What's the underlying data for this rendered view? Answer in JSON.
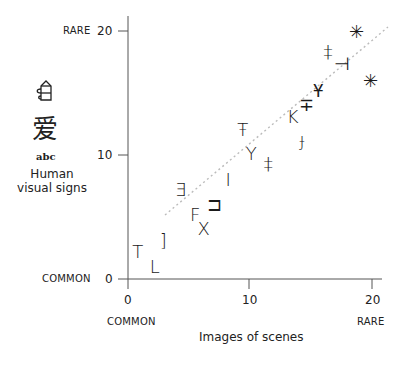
{
  "chart_data": {
    "type": "scatter",
    "title": "",
    "xlabel": "Images of scenes",
    "ylabel": "Human visual signs",
    "xlim": [
      0,
      20
    ],
    "ylim": [
      0,
      20
    ],
    "x_ticks": [
      "0",
      "10",
      "20"
    ],
    "y_ticks": [
      "0",
      "10",
      "20"
    ],
    "x_tick_annotations": {
      "0": "COMMON",
      "20": "RARE"
    },
    "y_tick_annotations": {
      "0": "COMMON",
      "20": "RARE"
    },
    "grid": false,
    "legend": null,
    "trend_line": {
      "style": "dotted",
      "from": [
        3.0,
        5.2
      ],
      "to": [
        21.3,
        20.3
      ]
    },
    "points": [
      {
        "glyph": "T",
        "x": 0.8,
        "y": 2.2
      },
      {
        "glyph": "L",
        "x": 2.2,
        "y": 1.0
      },
      {
        "glyph": "]",
        "x": 2.9,
        "y": 3.1
      },
      {
        "glyph": "∃",
        "x": 4.3,
        "y": 7.2
      },
      {
        "glyph": "F",
        "x": 5.5,
        "y": 5.2
      },
      {
        "glyph": "X",
        "x": 6.2,
        "y": 4.0
      },
      {
        "glyph": "⊐",
        "x": 7.1,
        "y": 6.0
      },
      {
        "glyph": "I",
        "x": 8.2,
        "y": 8.0
      },
      {
        "glyph": "Ŧ",
        "x": 9.4,
        "y": 12.0
      },
      {
        "glyph": "Y",
        "x": 10.1,
        "y": 10.1
      },
      {
        "glyph": "‡",
        "x": 11.5,
        "y": 9.3
      },
      {
        "glyph": "K",
        "x": 13.5,
        "y": 13.1
      },
      {
        "glyph": "∓",
        "x": 14.6,
        "y": 14.0
      },
      {
        "glyph": "ɟ",
        "x": 14.3,
        "y": 11.2
      },
      {
        "glyph": "Ұ",
        "x": 15.6,
        "y": 15.2
      },
      {
        "glyph": "‡",
        "x": 16.4,
        "y": 18.3
      },
      {
        "glyph": "⊣",
        "x": 17.5,
        "y": 17.3
      },
      {
        "glyph": "✳",
        "x": 18.7,
        "y": 19.9
      },
      {
        "glyph": "✳",
        "x": 19.9,
        "y": 16.0
      }
    ]
  },
  "labels": {
    "y_rare": "RARE",
    "y_common": "COMMON",
    "x_common": "COMMON",
    "x_rare": "RARE",
    "x_title": "Images of scenes",
    "y_title_line1": "Human",
    "y_title_line2": "visual signs",
    "y_tick_0": "0",
    "y_tick_10": "10",
    "y_tick_20": "20",
    "x_tick_0": "0",
    "x_tick_10": "10",
    "x_tick_20": "20",
    "sign_kanji": "爱",
    "sign_abc": "abc"
  }
}
